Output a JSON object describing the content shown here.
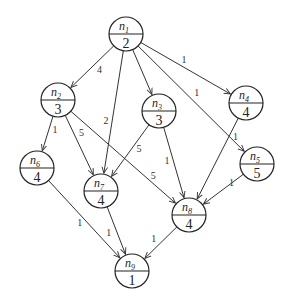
{
  "diagram": {
    "type": "task-graph",
    "nodes": [
      {
        "id": "n1",
        "name": "n",
        "index": "1",
        "weight": "2"
      },
      {
        "id": "n2",
        "name": "n",
        "index": "2",
        "weight": "3"
      },
      {
        "id": "n3",
        "name": "n",
        "index": "3",
        "weight": "3"
      },
      {
        "id": "n4",
        "name": "n",
        "index": "4",
        "weight": "4"
      },
      {
        "id": "n5",
        "name": "n",
        "index": "5",
        "weight": "5"
      },
      {
        "id": "n6",
        "name": "n",
        "index": "6",
        "weight": "4"
      },
      {
        "id": "n7",
        "name": "n",
        "index": "7",
        "weight": "4"
      },
      {
        "id": "n8",
        "name": "n",
        "index": "8",
        "weight": "4"
      },
      {
        "id": "n9",
        "name": "n",
        "index": "9",
        "weight": "1"
      }
    ],
    "edges": [
      {
        "from": "n1",
        "to": "n2",
        "label": "4"
      },
      {
        "from": "n1",
        "to": "n7",
        "label": "2"
      },
      {
        "from": "n1",
        "to": "n3",
        "label": ""
      },
      {
        "from": "n1",
        "to": "n4",
        "label": "1"
      },
      {
        "from": "n1",
        "to": "n5",
        "label": "1"
      },
      {
        "from": "n2",
        "to": "n6",
        "label": "1"
      },
      {
        "from": "n2",
        "to": "n7",
        "label": "5"
      },
      {
        "from": "n2",
        "to": "n8",
        "label": "5"
      },
      {
        "from": "n3",
        "to": "n7",
        "label": "5"
      },
      {
        "from": "n3",
        "to": "n8",
        "label": "1"
      },
      {
        "from": "n4",
        "to": "n8",
        "label": "1"
      },
      {
        "from": "n5",
        "to": "n8",
        "label": "1"
      },
      {
        "from": "n6",
        "to": "n9",
        "label": "1"
      },
      {
        "from": "n7",
        "to": "n9",
        "label": "1"
      },
      {
        "from": "n8",
        "to": "n9",
        "label": "1"
      }
    ]
  }
}
